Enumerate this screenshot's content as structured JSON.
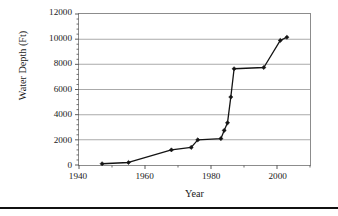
{
  "figure": {
    "background_color": "#ffffff",
    "frame_color": "#8c8c8c",
    "grid_color": "#aaaaaa",
    "series_color": "#141414",
    "rule_color": "#111111"
  },
  "axes": {
    "ylabel": "Water Depth (Ft)",
    "xlabel": "Year",
    "yticks": [
      0,
      2000,
      4000,
      6000,
      8000,
      10000,
      12000
    ],
    "ytick_labels": [
      "0",
      "2000",
      "4000",
      "6000",
      "8000",
      "10000",
      "12000"
    ],
    "xticks": [
      1940,
      1960,
      1980,
      2000
    ],
    "xtick_labels": [
      "1940",
      "1960",
      "1980",
      "2000"
    ],
    "xminor_ticks": [
      1950,
      1970,
      1990,
      2010
    ],
    "yminor_count": 4
  },
  "chart_data": {
    "type": "line",
    "title": "",
    "subtitle": "",
    "xlabel": "Year",
    "ylabel": "Water Depth (Ft)",
    "xlim": [
      1940,
      2010
    ],
    "ylim": [
      0,
      12000
    ],
    "grid": true,
    "grid_axis": "y",
    "legend": false,
    "legend_position": "none",
    "marker": "filled-diamond",
    "series": [
      {
        "name": "Water Depth",
        "x": [
          1947,
          1955,
          1968,
          1974,
          1976,
          1983,
          1984,
          1985,
          1986,
          1987,
          1996,
          2001,
          2003
        ],
        "y": [
          100,
          200,
          1200,
          1400,
          2000,
          2100,
          2750,
          3350,
          5400,
          7650,
          7750,
          9900,
          10150
        ]
      }
    ],
    "annotations": []
  }
}
